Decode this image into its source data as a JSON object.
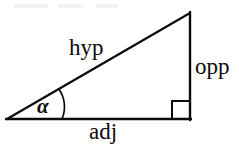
{
  "figure": {
    "name": "right-triangle-trigonometry-diagram",
    "background_color": "#ffffff",
    "stroke_color": "#0b0b0b",
    "labels": {
      "hypotenuse": "hyp",
      "opposite": "opp",
      "adjacent": "adj",
      "angle": "α"
    },
    "geometry": {
      "left_vertex": [
        7,
        119
      ],
      "right_vertex": [
        190,
        119
      ],
      "apex_vertex": [
        190,
        13
      ],
      "right_angle_square_size": 18,
      "angle_arc_radius": 31
    },
    "artifacts": [
      {
        "x": 14,
        "y": 4,
        "width": 34
      },
      {
        "x": 58,
        "y": 4,
        "width": 26
      },
      {
        "x": 96,
        "y": 4,
        "width": 22
      }
    ]
  }
}
